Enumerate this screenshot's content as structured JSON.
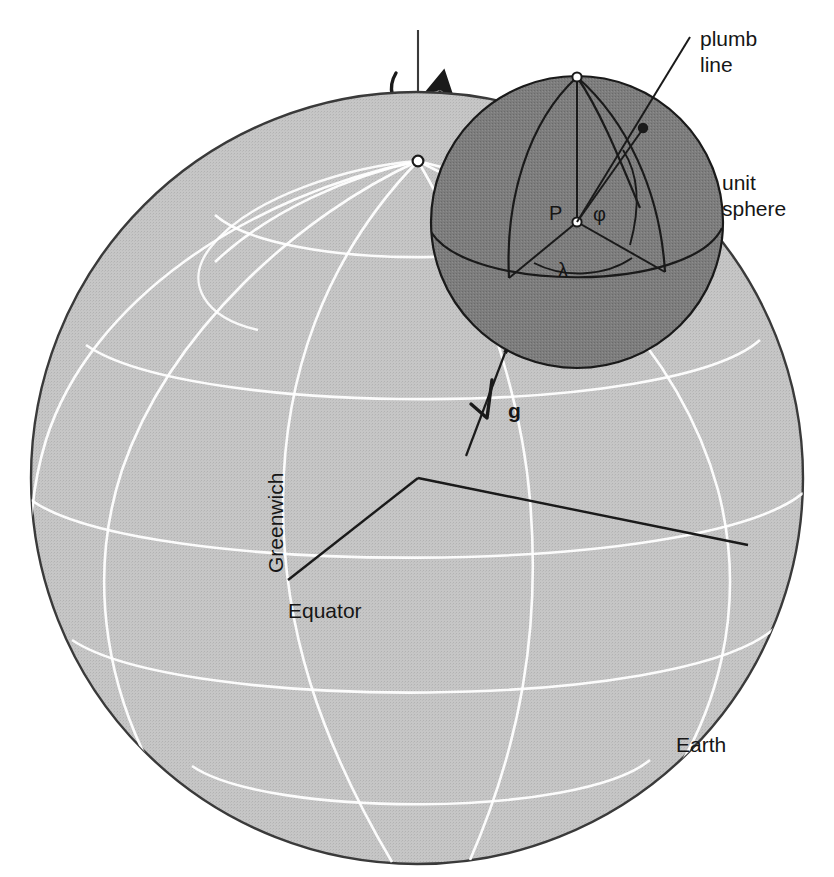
{
  "figure": {
    "domain": "diagram",
    "background_color": "#ffffff",
    "width": 834,
    "height": 877
  },
  "colors": {
    "earth_fill": "#c2c2c2",
    "earth_outline": "#333333",
    "unit_sphere_fill": "#7d7d7d",
    "unit_sphere_outline": "#1a1a1a",
    "graticule_white": "#ffffff",
    "line_black": "#1a1a1a",
    "text": "#161616"
  },
  "earth": {
    "label": "Earth",
    "center_x": 417,
    "center_y": 478,
    "radius": 386,
    "equator_label": "Equator",
    "greenwich_label": "Greenwich",
    "north_pole_marker": "north-pole-point"
  },
  "unit_sphere": {
    "label_line1": "unit",
    "label_line2": "sphere",
    "center_x": 577,
    "center_y": 222,
    "radius": 146,
    "station_label": "P",
    "latitude_symbol": "φ",
    "longitude_symbol": "λ"
  },
  "plumb_line": {
    "label_line1": "plumb",
    "label_line2": "line"
  },
  "gravity_vector": {
    "label": "g"
  },
  "rotation": {
    "axis_label": "",
    "arrow_name": "rotation-arrow"
  },
  "annotations": [
    {
      "name": "plumb-line-label",
      "text": "plumb line"
    },
    {
      "name": "unit-sphere-label",
      "text": "unit sphere"
    },
    {
      "name": "earth-label",
      "text": "Earth"
    },
    {
      "name": "equator-label",
      "text": "Equator"
    },
    {
      "name": "greenwich-label",
      "text": "Greenwich"
    },
    {
      "name": "point-p-label",
      "text": "P"
    },
    {
      "name": "phi-label",
      "text": "φ"
    },
    {
      "name": "lambda-label",
      "text": "λ"
    },
    {
      "name": "gravity-label",
      "text": "g"
    }
  ]
}
